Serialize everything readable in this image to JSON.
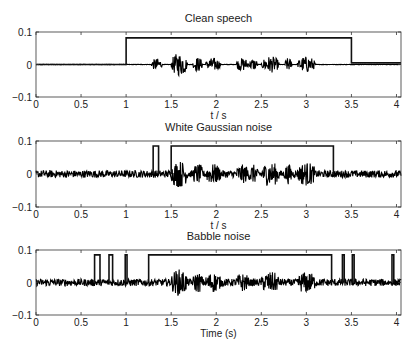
{
  "chart_data": [
    {
      "type": "line",
      "title": "Clean speech",
      "xlabel": "t / s",
      "ylabel": "",
      "xlim": [
        0,
        4.05
      ],
      "ylim": [
        -0.1,
        0.1
      ],
      "xticks": [
        "0",
        "0.5",
        "1",
        "1.5",
        "2",
        "2.5",
        "3",
        "3.5",
        "4"
      ],
      "yticks": [
        "-0.1",
        "0",
        "0.1"
      ],
      "grid": false,
      "series": [
        {
          "name": "speech waveform",
          "kind": "waveform",
          "noise_amp": 0.0005,
          "bursts": [
            [
              1.28,
              1.4,
              0.018
            ],
            [
              1.5,
              1.68,
              0.035
            ],
            [
              1.74,
              1.85,
              0.022
            ],
            [
              1.88,
              2.05,
              0.02
            ],
            [
              2.22,
              2.36,
              0.02
            ],
            [
              2.36,
              2.46,
              0.018
            ],
            [
              2.5,
              2.7,
              0.025
            ],
            [
              2.76,
              2.84,
              0.02
            ],
            [
              2.9,
              3.1,
              0.025
            ]
          ]
        },
        {
          "name": "VAD decision",
          "kind": "step",
          "points": [
            [
              0,
              0
            ],
            [
              1.0,
              0
            ],
            [
              1.0,
              0.082
            ],
            [
              3.5,
              0.082
            ],
            [
              3.5,
              0.005
            ],
            [
              4.05,
              0.005
            ]
          ]
        }
      ]
    },
    {
      "type": "line",
      "title": "White Gaussian noise",
      "xlabel": "t / s",
      "ylabel": "",
      "xlim": [
        0,
        4.05
      ],
      "ylim": [
        -0.1,
        0.1
      ],
      "xticks": [
        "0",
        "0.5",
        "1",
        "1.5",
        "2",
        "2.5",
        "3",
        "3.5",
        "4"
      ],
      "yticks": [
        "-0.1",
        "0",
        "0.1"
      ],
      "grid": false,
      "series": [
        {
          "name": "noisy waveform",
          "kind": "waveform",
          "noise_amp": 0.011,
          "bursts": [
            [
              1.5,
              1.68,
              0.03
            ],
            [
              1.74,
              1.85,
              0.02
            ],
            [
              1.88,
              2.05,
              0.02
            ],
            [
              2.22,
              2.36,
              0.018
            ],
            [
              2.36,
              2.46,
              0.018
            ],
            [
              2.5,
              2.7,
              0.025
            ],
            [
              2.76,
              2.84,
              0.02
            ],
            [
              2.9,
              3.1,
              0.025
            ]
          ]
        },
        {
          "name": "VAD decision",
          "kind": "pulses",
          "level": 0.085,
          "segments": [
            [
              1.3,
              1.36
            ],
            [
              1.5,
              3.3
            ]
          ]
        }
      ]
    },
    {
      "type": "line",
      "title": "Babble noise",
      "xlabel": "Time (s)",
      "ylabel": "",
      "xlim": [
        0,
        4.05
      ],
      "ylim": [
        -0.1,
        0.1
      ],
      "xticks": [
        "0",
        "0.5",
        "1",
        "1.5",
        "2",
        "2.5",
        "3",
        "3.5",
        "4"
      ],
      "yticks": [
        "-0.1",
        "0",
        "0.1"
      ],
      "grid": false,
      "series": [
        {
          "name": "noisy waveform",
          "kind": "waveform",
          "noise_amp": 0.011,
          "bursts": [
            [
              1.5,
              1.68,
              0.03
            ],
            [
              1.74,
              1.85,
              0.02
            ],
            [
              1.88,
              2.05,
              0.02
            ],
            [
              2.22,
              2.36,
              0.018
            ],
            [
              2.5,
              2.7,
              0.022
            ],
            [
              2.9,
              3.1,
              0.022
            ]
          ]
        },
        {
          "name": "VAD decision",
          "kind": "pulses",
          "level": 0.085,
          "segments": [
            [
              0.65,
              0.71
            ],
            [
              0.81,
              0.85
            ],
            [
              0.99,
              1.01
            ],
            [
              1.25,
              3.28
            ],
            [
              3.4,
              3.42
            ],
            [
              3.51,
              3.53
            ],
            [
              3.95,
              3.97
            ]
          ]
        }
      ]
    }
  ]
}
